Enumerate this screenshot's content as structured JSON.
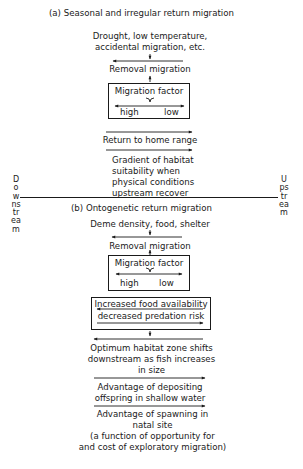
{
  "section_a": {
    "title": "(a) Seasonal and irregular return migration",
    "cause_line1": "Drought, low temperature,",
    "cause_line2": "accidental migration, etc.",
    "removal": "Removal migration",
    "factor_box": {
      "title": "Migration factor",
      "high": "high",
      "low": "low"
    },
    "return": "Return to home range",
    "gradient_lines": [
      "Gradient of habitat",
      "suitability when",
      "physical conditions",
      "upstream recover"
    ]
  },
  "axis": {
    "left_label": "Downstream",
    "right_label": "Upstream"
  },
  "section_b": {
    "title": "(b) Ontogenetic return migration",
    "cause": "Deme density, food, shelter",
    "removal": "Removal migration",
    "factor_box": {
      "title": "Migration factor",
      "high": "high",
      "low": "low"
    },
    "food_box": {
      "line1": "Increased food availability",
      "line2": "decreased predation risk"
    },
    "optimum_lines": [
      "Optimum habitat zone shifts",
      "downstream as fish increases",
      "in size"
    ],
    "depositing_lines": [
      "Advantage of depositing",
      "offspring in shallow water"
    ],
    "spawning_lines": [
      "Advantage of spawning in",
      "natal site",
      "(a function of opportunity for",
      "and cost of exploratory migration)"
    ]
  }
}
